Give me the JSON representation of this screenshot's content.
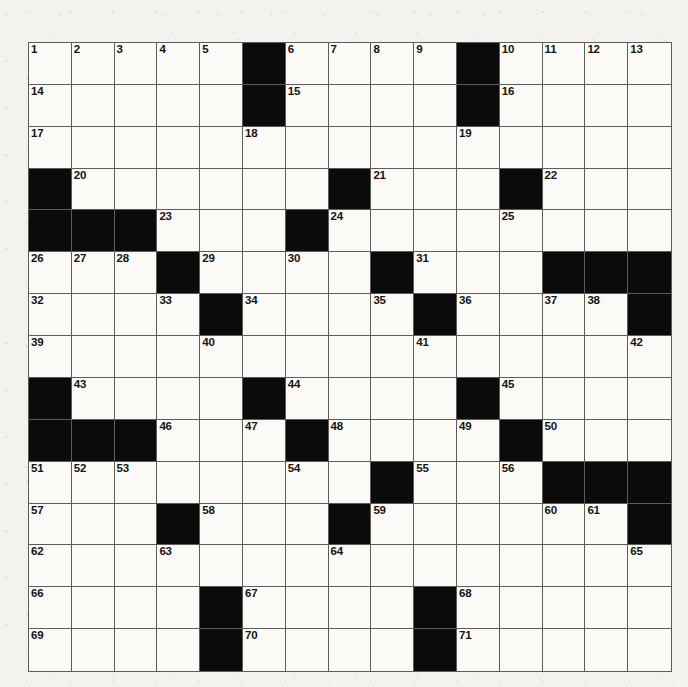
{
  "puzzle": {
    "type": "crossword-grid",
    "rows": 16,
    "cols": 15,
    "colors": {
      "page_background": "#f3f2ef",
      "cell_fill": "#fbfaf7",
      "block_fill": "#0b0b0b",
      "grid_line": "#5c5c5c",
      "border": "#4a4a4a",
      "number_text": "#141414"
    },
    "geometry": {
      "left": 28,
      "top": 42,
      "cell_size": 42.8,
      "width": 642,
      "height": 628
    },
    "legend": {
      "0": "white-open-square",
      "1": "black-blocked-square"
    },
    "blocks": [
      [
        0,
        0,
        0,
        0,
        0,
        1,
        0,
        0,
        0,
        0,
        1,
        0,
        0,
        0,
        0
      ],
      [
        0,
        0,
        0,
        0,
        0,
        1,
        0,
        0,
        0,
        0,
        1,
        0,
        0,
        0,
        0
      ],
      [
        0,
        0,
        0,
        0,
        0,
        0,
        0,
        0,
        0,
        0,
        0,
        0,
        0,
        0,
        0
      ],
      [
        1,
        0,
        0,
        0,
        0,
        0,
        0,
        1,
        0,
        0,
        0,
        1,
        0,
        0,
        0
      ],
      [
        1,
        1,
        1,
        0,
        0,
        0,
        1,
        0,
        0,
        0,
        0,
        0,
        0,
        0,
        0
      ],
      [
        0,
        0,
        0,
        1,
        0,
        0,
        0,
        0,
        1,
        0,
        0,
        0,
        1,
        1,
        1
      ],
      [
        0,
        0,
        0,
        0,
        1,
        0,
        0,
        0,
        0,
        1,
        0,
        0,
        0,
        0,
        1
      ],
      [
        0,
        0,
        0,
        0,
        0,
        0,
        0,
        0,
        0,
        0,
        0,
        0,
        0,
        0,
        0
      ],
      [
        1,
        0,
        0,
        0,
        0,
        1,
        0,
        0,
        0,
        0,
        1,
        0,
        0,
        0,
        0
      ],
      [
        1,
        1,
        1,
        0,
        0,
        0,
        1,
        0,
        0,
        0,
        0,
        1,
        0,
        0,
        0
      ],
      [
        0,
        0,
        0,
        0,
        0,
        0,
        0,
        0,
        1,
        0,
        0,
        0,
        1,
        1,
        1
      ],
      [
        0,
        0,
        0,
        1,
        0,
        0,
        0,
        1,
        0,
        0,
        0,
        0,
        0,
        0,
        1
      ],
      [
        0,
        0,
        0,
        0,
        0,
        0,
        0,
        0,
        0,
        0,
        0,
        0,
        0,
        0,
        0
      ],
      [
        0,
        0,
        0,
        0,
        1,
        0,
        0,
        0,
        0,
        1,
        0,
        0,
        0,
        0,
        0
      ],
      [
        0,
        0,
        0,
        0,
        1,
        0,
        0,
        0,
        0,
        1,
        0,
        0,
        0,
        0,
        0
      ]
    ],
    "numbers": [
      {
        "row": 0,
        "col": 0,
        "n": "1"
      },
      {
        "row": 0,
        "col": 1,
        "n": "2"
      },
      {
        "row": 0,
        "col": 2,
        "n": "3"
      },
      {
        "row": 0,
        "col": 3,
        "n": "4"
      },
      {
        "row": 0,
        "col": 4,
        "n": "5"
      },
      {
        "row": 0,
        "col": 6,
        "n": "6"
      },
      {
        "row": 0,
        "col": 7,
        "n": "7"
      },
      {
        "row": 0,
        "col": 8,
        "n": "8"
      },
      {
        "row": 0,
        "col": 9,
        "n": "9"
      },
      {
        "row": 0,
        "col": 11,
        "n": "10"
      },
      {
        "row": 0,
        "col": 12,
        "n": "11"
      },
      {
        "row": 0,
        "col": 13,
        "n": "12"
      },
      {
        "row": 0,
        "col": 14,
        "n": "13"
      },
      {
        "row": 1,
        "col": 0,
        "n": "14"
      },
      {
        "row": 1,
        "col": 6,
        "n": "15"
      },
      {
        "row": 1,
        "col": 11,
        "n": "16"
      },
      {
        "row": 2,
        "col": 0,
        "n": "17"
      },
      {
        "row": 2,
        "col": 5,
        "n": "18"
      },
      {
        "row": 2,
        "col": 10,
        "n": "19"
      },
      {
        "row": 3,
        "col": 1,
        "n": "20"
      },
      {
        "row": 3,
        "col": 8,
        "n": "21"
      },
      {
        "row": 3,
        "col": 12,
        "n": "22"
      },
      {
        "row": 4,
        "col": 3,
        "n": "23"
      },
      {
        "row": 4,
        "col": 7,
        "n": "24"
      },
      {
        "row": 4,
        "col": 11,
        "n": "25"
      },
      {
        "row": 5,
        "col": 0,
        "n": "26"
      },
      {
        "row": 5,
        "col": 1,
        "n": "27"
      },
      {
        "row": 5,
        "col": 2,
        "n": "28"
      },
      {
        "row": 5,
        "col": 4,
        "n": "29"
      },
      {
        "row": 5,
        "col": 6,
        "n": "30"
      },
      {
        "row": 5,
        "col": 9,
        "n": "31"
      },
      {
        "row": 6,
        "col": 0,
        "n": "32"
      },
      {
        "row": 6,
        "col": 3,
        "n": "33"
      },
      {
        "row": 6,
        "col": 5,
        "n": "34"
      },
      {
        "row": 6,
        "col": 8,
        "n": "35"
      },
      {
        "row": 6,
        "col": 10,
        "n": "36"
      },
      {
        "row": 6,
        "col": 12,
        "n": "37"
      },
      {
        "row": 6,
        "col": 13,
        "n": "38"
      },
      {
        "row": 7,
        "col": 0,
        "n": "39"
      },
      {
        "row": 7,
        "col": 4,
        "n": "40"
      },
      {
        "row": 7,
        "col": 9,
        "n": "41"
      },
      {
        "row": 7,
        "col": 14,
        "n": "42"
      },
      {
        "row": 8,
        "col": 1,
        "n": "43"
      },
      {
        "row": 8,
        "col": 6,
        "n": "44"
      },
      {
        "row": 8,
        "col": 11,
        "n": "45"
      },
      {
        "row": 9,
        "col": 3,
        "n": "46"
      },
      {
        "row": 9,
        "col": 5,
        "n": "47"
      },
      {
        "row": 9,
        "col": 7,
        "n": "48"
      },
      {
        "row": 9,
        "col": 10,
        "n": "49"
      },
      {
        "row": 9,
        "col": 12,
        "n": "50"
      },
      {
        "row": 10,
        "col": 0,
        "n": "51"
      },
      {
        "row": 10,
        "col": 1,
        "n": "52"
      },
      {
        "row": 10,
        "col": 2,
        "n": "53"
      },
      {
        "row": 10,
        "col": 6,
        "n": "54"
      },
      {
        "row": 10,
        "col": 9,
        "n": "55"
      },
      {
        "row": 10,
        "col": 11,
        "n": "56"
      },
      {
        "row": 11,
        "col": 0,
        "n": "57"
      },
      {
        "row": 11,
        "col": 4,
        "n": "58"
      },
      {
        "row": 11,
        "col": 8,
        "n": "59"
      },
      {
        "row": 11,
        "col": 12,
        "n": "60"
      },
      {
        "row": 11,
        "col": 13,
        "n": "61"
      },
      {
        "row": 12,
        "col": 0,
        "n": "62"
      },
      {
        "row": 12,
        "col": 3,
        "n": "63"
      },
      {
        "row": 12,
        "col": 7,
        "n": "64"
      },
      {
        "row": 12,
        "col": 14,
        "n": "65"
      },
      {
        "row": 13,
        "col": 0,
        "n": "66"
      },
      {
        "row": 13,
        "col": 5,
        "n": "67"
      },
      {
        "row": 13,
        "col": 10,
        "n": "68"
      },
      {
        "row": 14,
        "col": 0,
        "n": "69"
      },
      {
        "row": 14,
        "col": 5,
        "n": "70"
      },
      {
        "row": 14,
        "col": 10,
        "n": "71"
      }
    ]
  }
}
